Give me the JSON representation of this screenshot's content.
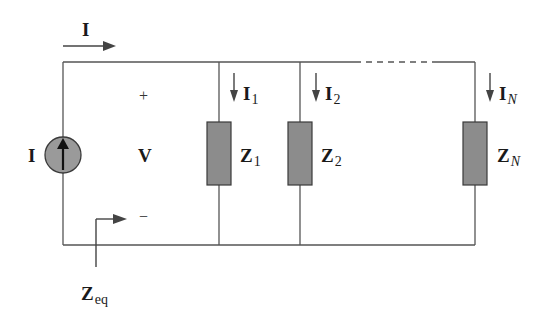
{
  "diagram": {
    "type": "parallel-impedance-circuit",
    "source": {
      "label": "I",
      "kind": "current-source",
      "direction": "up"
    },
    "total_current": {
      "label": "I",
      "direction": "right"
    },
    "voltage": {
      "label": "V",
      "plus": "+",
      "minus": "−"
    },
    "equivalent_impedance": {
      "main": "Z",
      "sub": "eq"
    },
    "branches": [
      {
        "current_main": "I",
        "current_sub": "1",
        "impedance_main": "Z",
        "impedance_sub": "1",
        "sub_italic": false
      },
      {
        "current_main": "I",
        "current_sub": "2",
        "impedance_main": "Z",
        "impedance_sub": "2",
        "sub_italic": false
      },
      {
        "current_main": "I",
        "current_sub": "N",
        "impedance_main": "Z",
        "impedance_sub": "N",
        "sub_italic": true
      }
    ],
    "colors": {
      "wire": "#555555",
      "impedance_fill": "#8c8c8c",
      "impedance_stroke": "#3a3a3a",
      "source_fill": "#9a9a9a",
      "arrow": "#444444",
      "text": "#1a1a1a"
    }
  }
}
